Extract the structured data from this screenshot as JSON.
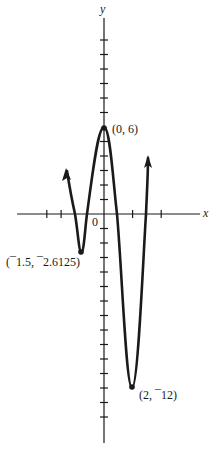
{
  "chart_data": {
    "type": "line",
    "title": "",
    "xlabel": "x",
    "ylabel": "y",
    "origin_label": "0",
    "grid": false,
    "xlim": [
      -6.1,
      6.9
    ],
    "ylim": [
      -15.8,
      13.8
    ],
    "x_ticks": [
      -4,
      -3,
      2,
      4
    ],
    "y_ticks": [
      12,
      11,
      10,
      9,
      8,
      7,
      5,
      4,
      3,
      2,
      1,
      -1,
      -2,
      -3,
      -4,
      -5,
      -6,
      -7,
      -8,
      -9,
      -10,
      -11,
      -12,
      -13,
      -14
    ],
    "key_points": [
      {
        "x": -1.5,
        "y": -2.6125,
        "label": "(¯1.5, ¯2.6125)",
        "type": "local minimum"
      },
      {
        "x": 0,
        "y": 6,
        "label": "(0, 6)",
        "type": "local maximum"
      },
      {
        "x": 2,
        "y": -12,
        "label": "(2, ¯12)",
        "type": "local minimum"
      }
    ],
    "x_intercepts_approx": [
      -2.1,
      -1.2,
      0.9,
      3.0
    ],
    "curve_points": [
      [
        -2.6,
        3.0
      ],
      [
        -2.1,
        0
      ],
      [
        -1.5,
        -2.6125
      ],
      [
        -1.2,
        0
      ],
      [
        -0.6,
        4.3
      ],
      [
        0,
        6
      ],
      [
        0.5,
        4.0
      ],
      [
        0.9,
        0
      ],
      [
        1.4,
        -8.5
      ],
      [
        2,
        -12
      ],
      [
        2.6,
        -8.5
      ],
      [
        3.0,
        0
      ],
      [
        3.1,
        3.9
      ]
    ],
    "end_behavior": "arrows on both ends pointing upward"
  },
  "labels": {
    "x_axis": "x",
    "y_axis": "y",
    "origin": "0",
    "peak": "(0, 6)",
    "left_min": "(¯1.5, ¯2.6125)",
    "right_min": "(2, ¯12)"
  },
  "style": {
    "ink": "#1a1a1a",
    "background": "#ffffff"
  }
}
